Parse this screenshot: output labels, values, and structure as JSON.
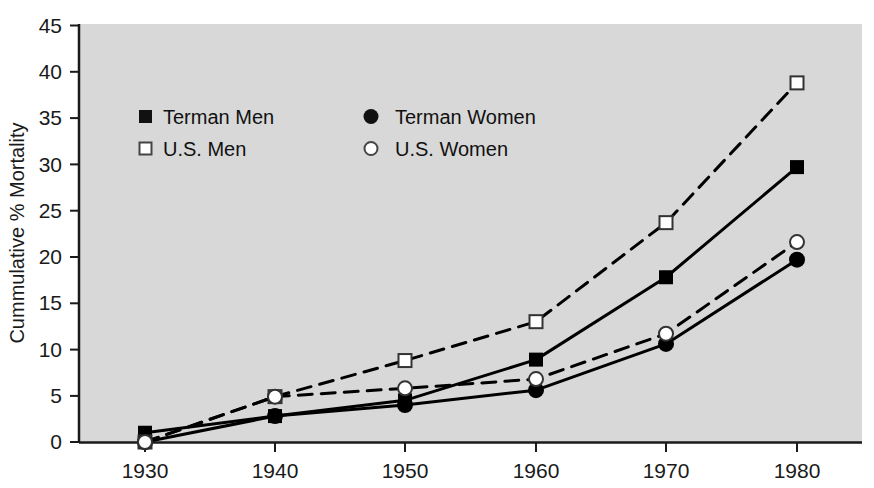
{
  "chart_data": {
    "type": "line",
    "title": "",
    "subtitle": "",
    "xlabel": "",
    "ylabel": "Cummulative % Mortality",
    "x": [
      1930,
      1940,
      1950,
      1960,
      1970,
      1980
    ],
    "categories": [
      "1930",
      "1940",
      "1950",
      "1960",
      "1970",
      "1980"
    ],
    "xlim": [
      1925,
      1985
    ],
    "ylim": [
      0,
      45
    ],
    "yticks": [
      0,
      5,
      10,
      15,
      20,
      25,
      30,
      35,
      40,
      45
    ],
    "ytick_labels": [
      "0",
      "5",
      "10",
      "15",
      "20",
      "25",
      "30",
      "35",
      "40",
      "45"
    ],
    "xticks": [
      1930,
      1940,
      1950,
      1960,
      1970,
      1980
    ],
    "xtick_labels": [
      "1930",
      "1940",
      "1950",
      "1960",
      "1970",
      "1980"
    ],
    "grid": false,
    "legend_position": "upper-left-inside",
    "plot_background": "#d8d8d8",
    "series": [
      {
        "name": "Terman Men",
        "marker": "filled-square",
        "line_style": "solid",
        "color": "#000000",
        "values": [
          1.0,
          2.8,
          4.5,
          8.9,
          17.8,
          29.7
        ]
      },
      {
        "name": "U.S. Men",
        "marker": "open-square",
        "line_style": "dashed",
        "color": "#000000",
        "values": [
          0.0,
          4.9,
          8.8,
          13.0,
          23.7,
          38.8
        ]
      },
      {
        "name": "Terman Women",
        "marker": "filled-circle",
        "line_style": "solid",
        "color": "#000000",
        "values": [
          0.0,
          2.8,
          4.0,
          5.6,
          10.6,
          19.7
        ]
      },
      {
        "name": "U.S. Women",
        "marker": "open-circle",
        "line_style": "dashed",
        "color": "#000000",
        "values": [
          0.0,
          4.9,
          5.8,
          6.8,
          11.7,
          21.6
        ]
      }
    ]
  },
  "axis": {
    "y_title": "Cummulative % Mortality",
    "y_labels": [
      "45",
      "40",
      "35",
      "30",
      "25",
      "20",
      "15",
      "10",
      "5",
      "0"
    ],
    "x_labels": [
      "1930",
      "1940",
      "1950",
      "1960",
      "1970",
      "1980"
    ]
  },
  "legend": {
    "entries": [
      {
        "label": "Terman Men",
        "marker": "filled-square"
      },
      {
        "label": "Terman Women",
        "marker": "filled-circle"
      },
      {
        "label": "U.S. Men",
        "marker": "open-square"
      },
      {
        "label": "U.S. Women",
        "marker": "open-circle"
      }
    ]
  }
}
